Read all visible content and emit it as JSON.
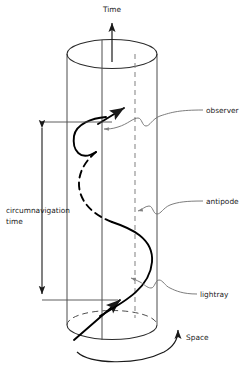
{
  "figure": {
    "background_color": "#ffffff",
    "line_color": "#4d4d4d",
    "curve_color": "#000000",
    "text_color": "#1a1a1a"
  },
  "axes": {
    "time_label": "Time",
    "space_label": "Space"
  },
  "measure": {
    "label_line1": "circumnavigation",
    "label_line2": "time"
  },
  "callouts": {
    "observer": "observer",
    "antipode": "antipode",
    "lightray": "lightray"
  },
  "icons": {
    "time_arrow": "arrow-up-icon",
    "space_arrow": "rotation-arrow-icon",
    "measure_arrow": "double-headed-arrow-icon",
    "lightray_arrow": "arrowhead-icon"
  }
}
